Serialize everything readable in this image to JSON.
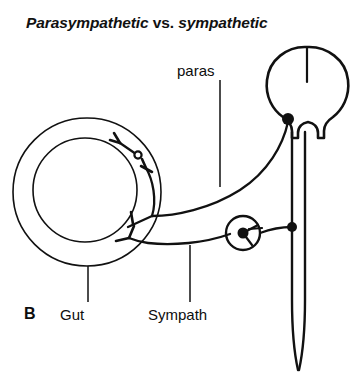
{
  "figure": {
    "panel_letter": "B",
    "title_italic_part_1": "Parasympathetic ",
    "title_upright_part": "vs.",
    "title_italic_part_2": " sympathetic",
    "title_full": "Parasympathetic vs. sympathetic"
  },
  "labels": {
    "paras": "paras",
    "gut": "Gut",
    "sympath": "Sympath"
  },
  "colors": {
    "ink": "#111111",
    "background": "#ffffff"
  },
  "anatomy": {
    "brain": {
      "name": "brain",
      "center_x": 307,
      "center_y": 88,
      "width": 78,
      "height": 82
    },
    "spinal_cord": {
      "name": "spinal-cord",
      "top_y": 130,
      "tip_y": 371,
      "left_x": 292,
      "right_x": 305
    },
    "gut": {
      "name": "gut",
      "center_x": 87,
      "center_y": 192,
      "outer_radius": 74,
      "inner_radius": 52
    },
    "brainstem_soma": {
      "name": "preganglionic-parasympathetic-cell-body",
      "x": 288,
      "y": 119,
      "radius": 6
    },
    "spinal_soma": {
      "name": "preganglionic-sympathetic-cell-body",
      "x": 292,
      "y": 227,
      "radius": 5
    },
    "sympathetic_ganglion": {
      "name": "sympathetic-ganglion",
      "x": 243,
      "y": 233,
      "radius": 17,
      "soma_radius": 5.5
    },
    "parasympathetic_ganglion": {
      "name": "parasympathetic-ganglion-in-gut-wall",
      "x": 138,
      "y": 155,
      "radius": 3.6
    }
  }
}
